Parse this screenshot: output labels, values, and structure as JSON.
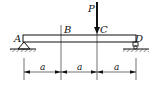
{
  "diagram": {
    "type": "simply-supported-beam",
    "points": {
      "A": "A",
      "B": "B",
      "C": "C",
      "D": "D"
    },
    "load": {
      "label": "P",
      "location": "C",
      "direction": "down"
    },
    "supports": {
      "left": "pin",
      "right": "roller"
    },
    "dimensions": [
      "a",
      "a",
      "a"
    ],
    "colors": {
      "stroke": "#111111",
      "background": "#ffffff"
    }
  }
}
